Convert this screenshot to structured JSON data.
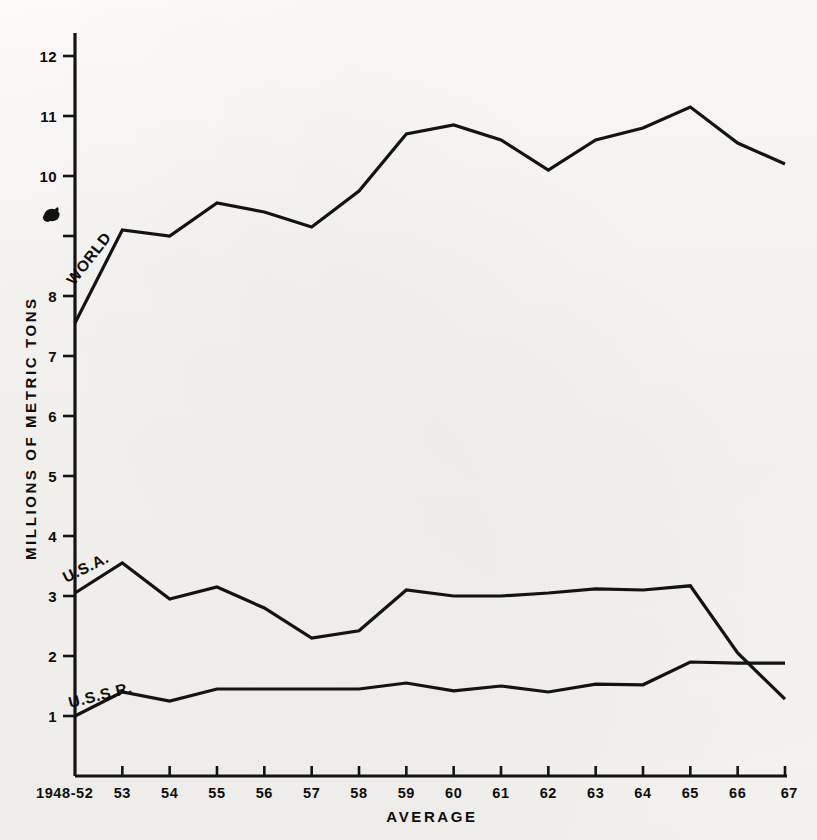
{
  "figure": {
    "background_color": "#f5f4f1",
    "ink_color": "#131313"
  },
  "chart_data": {
    "type": "line",
    "title": "",
    "xlabel": "AVERAGE",
    "ylabel": "MILLIONS OF METRIC TONS",
    "categories": [
      "1948-52",
      "53",
      "54",
      "55",
      "56",
      "57",
      "58",
      "59",
      "60",
      "61",
      "62",
      "63",
      "64",
      "65",
      "66",
      "67"
    ],
    "x_tick_labels": [
      "1948-52",
      "53",
      "54",
      "55",
      "56",
      "57",
      "58",
      "59",
      "60",
      "61",
      "62",
      "63",
      "64",
      "65",
      "66",
      "67"
    ],
    "y_tick_labels": [
      "1",
      "2",
      "3",
      "4",
      "5",
      "6",
      "7",
      "8",
      "9",
      "10",
      "11",
      "12"
    ],
    "y_ticks": [
      1,
      2,
      3,
      4,
      5,
      6,
      7,
      8,
      9,
      10,
      11,
      12
    ],
    "ylim": [
      0.35,
      12.3
    ],
    "xlim": [
      0,
      15
    ],
    "grid": false,
    "legend_position": "inline-labels",
    "series": [
      {
        "name": "WORLD",
        "label": "WORLD",
        "label_rotation_deg": -52,
        "values": [
          7.55,
          9.1,
          9.0,
          9.55,
          9.4,
          9.15,
          9.75,
          10.7,
          10.85,
          10.6,
          10.1,
          10.6,
          10.8,
          11.15,
          10.55,
          10.2
        ]
      },
      {
        "name": "U.S.A.",
        "label": "U.S.A.",
        "label_rotation_deg": -26,
        "values": [
          3.05,
          3.55,
          2.95,
          3.15,
          2.8,
          2.3,
          2.42,
          3.1,
          3.0,
          3.0,
          3.05,
          3.12,
          3.1,
          3.17,
          2.05,
          1.28
        ]
      },
      {
        "name": "U.S.S.R.",
        "label": "U.S.S.R.",
        "label_rotation_deg": -14,
        "values": [
          1.0,
          1.4,
          1.25,
          1.45,
          1.45,
          1.45,
          1.45,
          1.55,
          1.42,
          1.5,
          1.4,
          1.53,
          1.52,
          1.9,
          1.88,
          1.88
        ]
      }
    ]
  }
}
